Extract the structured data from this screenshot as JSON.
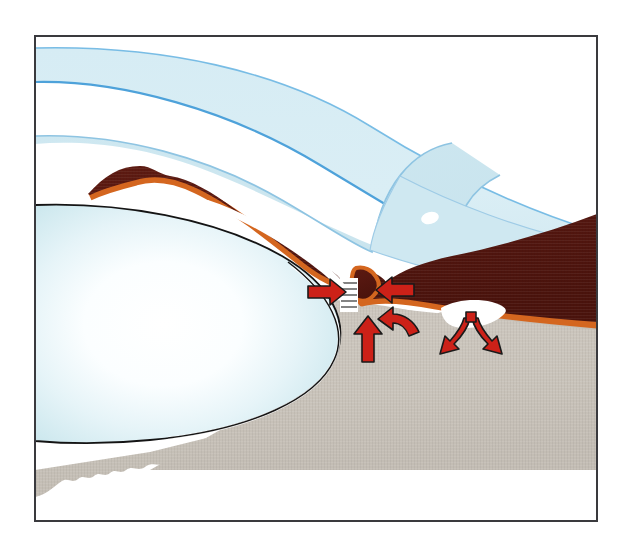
{
  "figure": {
    "title": "Anterior chamber angle of the eye — aqueous humour outflow",
    "width": 632,
    "height": 543,
    "background_color": "#ffffff",
    "frame": {
      "name": "illustration-border",
      "x": 34,
      "y": 35,
      "width": 564,
      "height": 487,
      "stroke_color": "#3a3a3e",
      "stroke_width": 2,
      "fill_color": "#ffffff"
    }
  },
  "palette": {
    "cornea_fill": "#d7ecf3",
    "cornea_stroke": "#54a8dc",
    "cornea_inner_fill": "#cde6ef",
    "cornea_inner_stroke": "#8ec4e2",
    "lens_edge": "#bfe0e7",
    "lens_center": "#ffffff",
    "lens_stroke": "#141414",
    "iris_fill": "#551710",
    "iris_highlight": "#6a2013",
    "iris_border": "#d4661f",
    "sclera_fill": "#cbc5bd",
    "sclera_shadow": "#c2bcb3",
    "schlemm_canal_fill": "#ffffff",
    "arrow_fill": "#cc2118",
    "arrow_stroke": "#1a1a1a",
    "white_highlight": "#ffffff"
  },
  "structures": [
    {
      "id": "cornea-outer-band",
      "label": "Cornea (outer stromal band)",
      "type": "curved-band",
      "fill": "#d7ecf3",
      "stroke": "#54a8dc"
    },
    {
      "id": "cornea-inner-band",
      "label": "Cornea inner layer / limbus",
      "type": "curved-band",
      "fill": "#cde6ef",
      "stroke": "#8ec4e2"
    },
    {
      "id": "lens",
      "label": "Crystalline lens",
      "type": "ellipse",
      "fill_center": "#ffffff",
      "fill_edge": "#bfe0e7",
      "stroke": "#141414"
    },
    {
      "id": "iris-ciliary-body",
      "label": "Iris and ciliary body",
      "type": "filled-shape",
      "fill": "#551710",
      "border": "#d4661f"
    },
    {
      "id": "sclera",
      "label": "Sclera (cut surface)",
      "type": "filled-shape",
      "fill": "#cbc5bd",
      "edge_style": "scalloped-cut"
    },
    {
      "id": "schlemm-canal",
      "label": "Schlemm's canal",
      "type": "lens-shaped-void",
      "fill": "#ffffff"
    },
    {
      "id": "trabecular-meshwork",
      "label": "Trabecular meshwork",
      "type": "striped-band",
      "fill": "#ffffff",
      "stripe": "#1a1a1a"
    },
    {
      "id": "specular-highlight",
      "label": "Specular highlight on sclera",
      "type": "ellipse",
      "fill": "#ffffff"
    }
  ],
  "flow_arrows": [
    {
      "id": "arrow-aqueous-outflow-right",
      "label": "Aqueous flowing outward toward the angle",
      "direction": "right",
      "x": 312,
      "y": 292,
      "length": 42,
      "fill": "#cc2118",
      "stroke": "#1a1a1a"
    },
    {
      "id": "arrow-aqueous-inflow-left",
      "label": "Aqueous entering the angle from the iris side",
      "direction": "left",
      "x": 372,
      "y": 290,
      "length": 44,
      "fill": "#cc2118",
      "stroke": "#1a1a1a"
    },
    {
      "id": "arrow-uveoscleral-up",
      "label": "Uveoscleral outflow ascending through ciliary body",
      "direction": "up",
      "x": 366,
      "y": 322,
      "length": 42,
      "fill": "#cc2118",
      "stroke": "#1a1a1a"
    },
    {
      "id": "arrow-curved-recirculation",
      "label": "Curved recirculation arrow toward the angle recess",
      "direction": "curved-up-left",
      "x": 390,
      "y": 318,
      "fill": "#cc2118",
      "stroke": "#1a1a1a"
    },
    {
      "id": "arrow-collector-channels-branching",
      "label": "Branching collector channels draining from Schlemm's canal",
      "direction": "y-split-down",
      "x": 470,
      "y": 318,
      "fill": "#cc2118",
      "stroke": "#1a1a1a"
    }
  ]
}
